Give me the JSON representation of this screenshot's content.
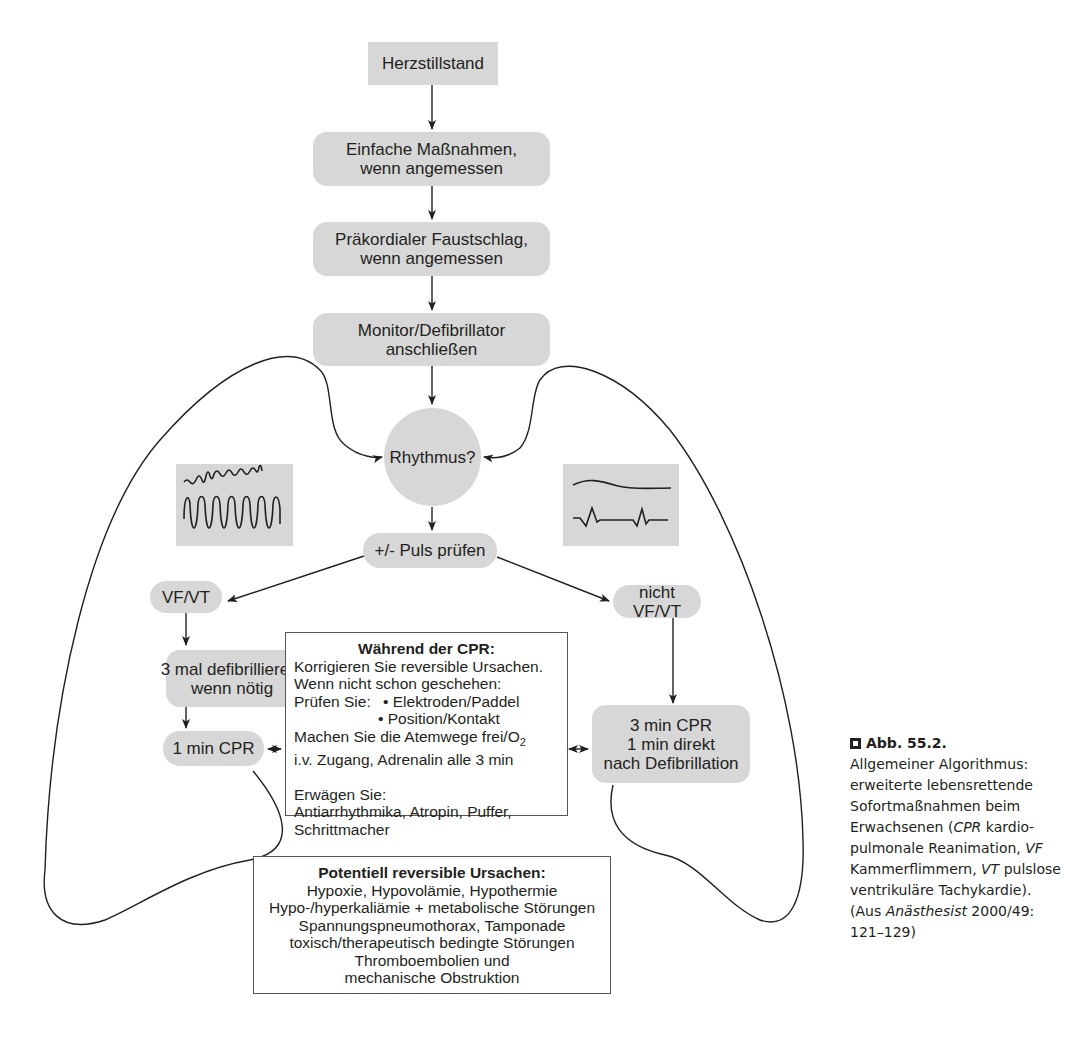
{
  "diagram": {
    "nodes": {
      "cardiac_arrest": "Herzstillstand",
      "simple_measures": [
        "Einfache Maßnahmen,",
        "wenn angemessen"
      ],
      "precordial_thump": [
        "Präkordialer Faustschlag,",
        "wenn angemessen"
      ],
      "monitor": [
        "Monitor/Defibrillator",
        "anschließen"
      ],
      "rhythm": "Rhythmus?",
      "pulse_check": "+/- Puls prüfen",
      "vf_vt": "VF/VT",
      "non_vf_vt": "nicht VF/VT",
      "defibrillate": [
        "3 mal defibrillieren,",
        "wenn nötig"
      ],
      "cpr_1min": "1 min CPR",
      "cpr_3min": [
        "3 min CPR",
        "1 min direkt",
        "nach Defibrillation"
      ]
    },
    "during_cpr": {
      "title": "Während der CPR:",
      "lines": [
        "Korrigieren Sie reversible Ursachen.",
        "Wenn nicht schon geschehen:",
        "Prüfen Sie:",
        "• Elektroden/Paddel",
        "• Position/Kontakt",
        "Machen Sie die Atemwege frei/O",
        "2",
        "i.v. Zugang, Adrenalin alle 3 min",
        "Erwägen Sie:",
        "Antiarrhythmika, Atropin, Puffer,",
        "Schrittmacher"
      ]
    },
    "reversible_causes": {
      "title": "Potentiell reversible Ursachen:",
      "lines": [
        "Hypoxie, Hypovolämie, Hypothermie",
        "Hypo-/hyperkaliämie + metabolische Störungen",
        "Spannungspneumothorax, Tamponade",
        "toxisch/therapeutisch bedingte Störungen",
        "Thromboembolien und",
        "mechanische Obstruktion"
      ]
    },
    "ecg_icons": {
      "left": "ventricular-fibrillation-tachycardia-ecg",
      "right": "asystole-pea-ecg"
    },
    "colors": {
      "node_fill": "#d7d7d7",
      "line": "#231f20",
      "box_border": "#555555"
    }
  },
  "caption": {
    "figure_label": "Abb. 55.2.",
    "text_1": "Allgemeiner Algorithmus: erweiterte lebensrettende Sofortmaßnahmen beim Erwachsenen (",
    "abbr_cpr": "CPR",
    "text_2": " kardio­pulmonale Reanimation, ",
    "abbr_vf": "VF",
    "text_3": " Kammerflimmern, ",
    "abbr_vt": "VT",
    "text_4": " pulslose ventrikuläre Ta­chykardie). (Aus ",
    "source_journal": "Anästhesist",
    "source_ref": " 2000/49: 121–129)"
  }
}
